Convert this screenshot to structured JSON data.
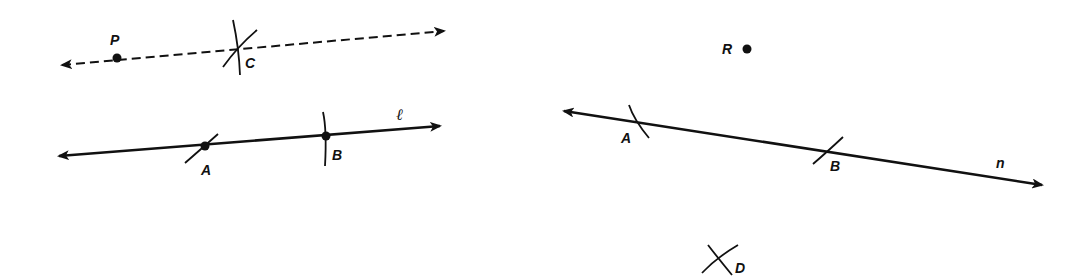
{
  "figure_left": {
    "dashed_line": {
      "style": "dashed",
      "start": [
        55,
        66
      ],
      "end": [
        450,
        30
      ],
      "arrows": "both"
    },
    "point_P": {
      "label": "P",
      "pos": [
        117,
        58
      ],
      "label_pos": [
        110,
        45
      ]
    },
    "point_C": {
      "label": "C",
      "pos": [
        237,
        48
      ],
      "label_pos": [
        245,
        68
      ]
    },
    "line_l": {
      "label": "ℓ",
      "start": [
        52,
        157
      ],
      "end": [
        446,
        126
      ],
      "label_pos": [
        396,
        120
      ]
    },
    "point_A": {
      "label": "A",
      "pos": [
        205,
        146
      ],
      "label_pos": [
        201,
        175
      ]
    },
    "point_B": {
      "label": "B",
      "pos": [
        326,
        136
      ],
      "label_pos": [
        332,
        160
      ]
    }
  },
  "figure_right": {
    "point_R": {
      "label": "R",
      "pos": [
        747,
        49
      ],
      "label_pos": [
        722,
        54
      ]
    },
    "line_n": {
      "label": "n",
      "start": [
        557,
        110
      ],
      "end": [
        1048,
        186
      ],
      "label_pos": [
        996,
        168
      ]
    },
    "point_A": {
      "label": "A",
      "pos": [
        633,
        121
      ],
      "label_pos": [
        621,
        143
      ]
    },
    "point_B": {
      "label": "B",
      "pos": [
        828,
        151
      ],
      "label_pos": [
        830,
        171
      ]
    },
    "point_D": {
      "label": "D",
      "pos": [
        719,
        260
      ],
      "label_pos": [
        733,
        273
      ]
    }
  },
  "colors": {
    "ink": "#111111",
    "background": "#ffffff"
  }
}
